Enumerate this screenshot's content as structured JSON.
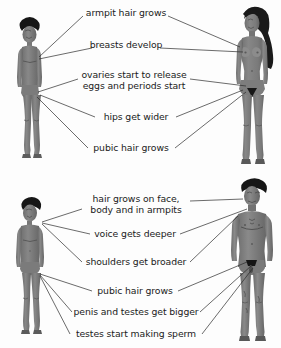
{
  "diagram": {
    "background_color": "#fdfdfd",
    "body_color": "#808080",
    "body_shadow_color": "#6d6d6d",
    "hair_color": "#1f1f1f",
    "line_color": "#2b2b2b",
    "text_color": "#1b1b1b"
  },
  "panels": [
    {
      "id": "female",
      "name": "female-puberty-panel",
      "child_figure_label": "girl-child-figure",
      "adult_figure_label": "adult-female-figure",
      "labels": [
        {
          "id": "armpit-hair",
          "text": "armpit hair grows",
          "lines": [
            "armpit hair grows"
          ]
        },
        {
          "id": "breasts-develop",
          "text": "breasts develop",
          "lines": [
            "breasts develop"
          ]
        },
        {
          "id": "ovaries-release",
          "text": "ovaries start to release eggs and periods start",
          "lines": [
            "ovaries start to release",
            "eggs and periods start"
          ]
        },
        {
          "id": "hips-wider",
          "text": "hips get wider",
          "lines": [
            "hips get wider"
          ]
        },
        {
          "id": "pubic-hair",
          "text": "pubic hair grows",
          "lines": [
            "pubic hair grows"
          ]
        }
      ]
    },
    {
      "id": "male",
      "name": "male-puberty-panel",
      "child_figure_label": "boy-child-figure",
      "adult_figure_label": "adult-male-figure",
      "labels": [
        {
          "id": "face-body-hair",
          "text": "hair grows on face, body and in armpits",
          "lines": [
            "hair grows on face,",
            "body and in armpits"
          ]
        },
        {
          "id": "voice-deeper",
          "text": "voice gets deeper",
          "lines": [
            "voice gets deeper"
          ]
        },
        {
          "id": "shoulders-broader",
          "text": "shoulders get broader",
          "lines": [
            "shoulders get broader"
          ]
        },
        {
          "id": "pubic-hair",
          "text": "pubic hair grows",
          "lines": [
            "pubic hair grows"
          ]
        },
        {
          "id": "penis-testes-bigger",
          "text": "penis and testes get bigger",
          "lines": [
            "penis and testes get bigger"
          ]
        },
        {
          "id": "testes-sperm",
          "text": "testes start making sperm",
          "lines": [
            "testes start making sperm"
          ]
        }
      ]
    }
  ]
}
